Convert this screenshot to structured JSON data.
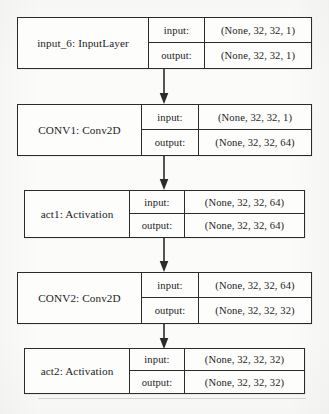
{
  "diagram": {
    "kind": "keras-model-plot",
    "io_labels": {
      "input": "input:",
      "output": "output:"
    },
    "colors": {
      "background": "#fbfbfa",
      "box_fill": "#fdfdfc",
      "stroke": "#2b2b2b",
      "text": "#1c1c1c"
    },
    "layers": [
      {
        "id": "input_6",
        "name": "input_6: InputLayer",
        "input_shape": "(None, 32, 32, 1)",
        "output_shape": "(None, 32, 32, 1)"
      },
      {
        "id": "conv1",
        "name": "CONV1: Conv2D",
        "input_shape": "(None, 32, 32, 1)",
        "output_shape": "(None, 32, 32, 64)"
      },
      {
        "id": "act1",
        "name": "act1: Activation",
        "input_shape": "(None, 32, 32, 64)",
        "output_shape": "(None, 32, 32, 64)"
      },
      {
        "id": "conv2",
        "name": "CONV2: Conv2D",
        "input_shape": "(None, 32, 32, 64)",
        "output_shape": "(None, 32, 32, 32)"
      },
      {
        "id": "act2",
        "name": "act2: Activation",
        "input_shape": "(None, 32, 32, 32)",
        "output_shape": "(None, 32, 32, 32)"
      }
    ],
    "edges": [
      {
        "from": "input_6",
        "to": "conv1"
      },
      {
        "from": "conv1",
        "to": "act1"
      },
      {
        "from": "act1",
        "to": "conv2"
      },
      {
        "from": "conv2",
        "to": "act2"
      }
    ]
  }
}
